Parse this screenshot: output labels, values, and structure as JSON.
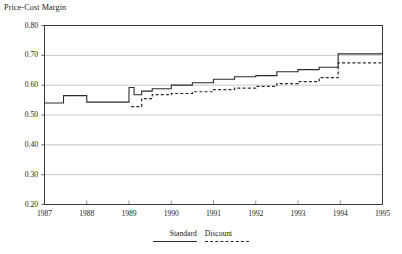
{
  "chart_data": {
    "type": "line",
    "title": "Price-Cost Margin",
    "xlabel": "",
    "ylabel": "",
    "grid": true,
    "legend_position": "bottom-center",
    "xlim": [
      1987,
      1995
    ],
    "ylim": [
      0.2,
      0.8
    ],
    "ytick_labels": [
      "0.80",
      "0.70",
      "0.60",
      "0.50",
      "0.40",
      "0.30",
      "0.20"
    ],
    "ytick_values": [
      0.8,
      0.7,
      0.6,
      0.5,
      0.4,
      0.3,
      0.2
    ],
    "xtick_labels": [
      "1987",
      "1988",
      "1989",
      "1990",
      "1991",
      "1992",
      "1993",
      "1994",
      "1995"
    ],
    "xtick_values": [
      1987,
      1988,
      1989,
      1990,
      1991,
      1992,
      1993,
      1994,
      1995
    ],
    "series": [
      {
        "name": "Standard",
        "style": "solid",
        "color": "#2b2b2b",
        "x": [
          1987.0,
          1987.45,
          1987.45,
          1988.0,
          1988.0,
          1989.0,
          1989.0,
          1989.12,
          1989.12,
          1989.3,
          1989.3,
          1989.55,
          1989.55,
          1990.0,
          1990.0,
          1990.5,
          1990.5,
          1991.0,
          1991.0,
          1991.5,
          1991.5,
          1992.0,
          1992.0,
          1992.5,
          1992.5,
          1993.0,
          1993.0,
          1993.5,
          1993.5,
          1993.95,
          1993.95,
          1995.0
        ],
        "y": [
          0.54,
          0.54,
          0.565,
          0.565,
          0.543,
          0.543,
          0.592,
          0.592,
          0.568,
          0.568,
          0.58,
          0.58,
          0.588,
          0.588,
          0.6,
          0.6,
          0.608,
          0.608,
          0.62,
          0.62,
          0.628,
          0.628,
          0.632,
          0.632,
          0.645,
          0.645,
          0.652,
          0.652,
          0.66,
          0.66,
          0.705,
          0.705
        ]
      },
      {
        "name": "Discount",
        "style": "dashed",
        "color": "#2b2b2b",
        "x": [
          1989.05,
          1989.3,
          1989.3,
          1989.55,
          1989.55,
          1990.0,
          1990.0,
          1990.5,
          1990.5,
          1991.0,
          1991.0,
          1991.5,
          1991.5,
          1992.0,
          1992.0,
          1992.5,
          1992.5,
          1993.0,
          1993.0,
          1993.5,
          1993.5,
          1993.95,
          1993.95,
          1995.0
        ],
        "y": [
          0.528,
          0.528,
          0.555,
          0.555,
          0.568,
          0.568,
          0.572,
          0.572,
          0.578,
          0.578,
          0.585,
          0.585,
          0.59,
          0.59,
          0.596,
          0.596,
          0.605,
          0.605,
          0.612,
          0.612,
          0.625,
          0.625,
          0.675,
          0.675
        ]
      }
    ],
    "legend": [
      {
        "label": "Standard",
        "style": "solid"
      },
      {
        "label": "Discount",
        "style": "dashed"
      }
    ]
  }
}
